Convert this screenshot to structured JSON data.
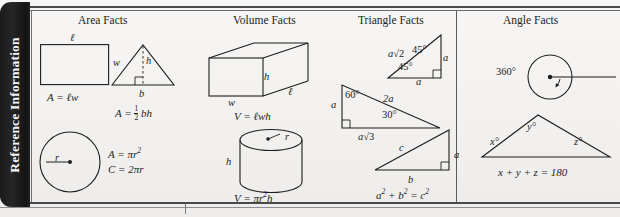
{
  "tab": {
    "label": "Reference Information"
  },
  "columns": [
    {
      "id": "area",
      "heading": "Area Facts"
    },
    {
      "id": "volume",
      "heading": "Volume Facts"
    },
    {
      "id": "triangle",
      "heading": "Triangle Facts"
    },
    {
      "id": "angle",
      "heading": "Angle Facts"
    }
  ],
  "area": {
    "rectangle": {
      "labels": {
        "length": "ℓ",
        "width": "w"
      },
      "formula_lead": "A = ",
      "formula_rest": "ℓw"
    },
    "triangle": {
      "labels": {
        "height": "h",
        "base": "b"
      },
      "formula_lead": "A = ",
      "frac_num": "1",
      "frac_den": "2",
      "formula_rest": "bh"
    },
    "circle": {
      "labels": {
        "radius": "r"
      },
      "formula_area_lead": "A = πr",
      "formula_area_sup": "2",
      "formula_circumference": "C = 2πr"
    }
  },
  "volume": {
    "prism": {
      "labels": {
        "height": "h",
        "width": "w",
        "length": "ℓ"
      },
      "formula": "V = ℓwh"
    },
    "cylinder": {
      "labels": {
        "radius": "r",
        "height": "h"
      },
      "formula_lead": "V = πr",
      "formula_sup": "2",
      "formula_rest": "h"
    }
  },
  "triangle_facts": {
    "isosceles_right": {
      "hypotenuse_lead": "a",
      "hypotenuse_radical": "√2",
      "leg_right": "a",
      "leg_bottom": "a",
      "angle_top": "45°",
      "angle_left": "45°"
    },
    "thirty_sixty": {
      "leg_left": "a",
      "angle_top": "60°",
      "hypotenuse": "2a",
      "angle_bottom": "30°",
      "base_lead": "a",
      "base_radical": "√3"
    },
    "pythagorean": {
      "hypotenuse": "c",
      "leg_vertical": "a",
      "leg_base": "b",
      "formula_a": "a",
      "formula_a_sup": "2",
      "formula_plus": " + b",
      "formula_b_sup": "2",
      "formula_eq": " = c",
      "formula_c_sup": "2"
    }
  },
  "angle_facts": {
    "circle": {
      "label": "360°"
    },
    "triangle": {
      "angle_x": "x°",
      "angle_y": "y°",
      "angle_z": "z°",
      "formula": "x + y + z = 180"
    }
  },
  "colors": {
    "ink": "#1d1d1d",
    "tab_bg": "#1a1a1a",
    "tab_text": "#f5f5f5",
    "paper": "#f4f3f1"
  }
}
